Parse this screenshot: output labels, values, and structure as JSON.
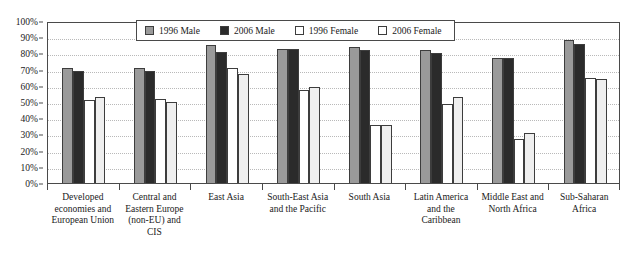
{
  "chart_data": {
    "type": "bar",
    "title": "",
    "subtitle": "",
    "xlabel": "",
    "ylabel": "",
    "ylim": [
      0,
      100
    ],
    "ytick_labels": [
      "0%",
      "10%",
      "20%",
      "30%",
      "40%",
      "50%",
      "60%",
      "70%",
      "80%",
      "90%",
      "100%"
    ],
    "ytick_values": [
      0,
      10,
      20,
      30,
      40,
      50,
      60,
      70,
      80,
      90,
      100
    ],
    "grid": true,
    "grid_axis": "y",
    "legend_position": "top-center",
    "categories": [
      "Developed economies and European Union",
      "Central and Eastern Europe (non-EU) and CIS",
      "East Asia",
      "South-East Asia and the Pacific",
      "South Asia",
      "Latin America and the Caribbean",
      "Middle East and North Africa",
      "Sub-Saharan Africa"
    ],
    "series": [
      {
        "name": "1996 Male",
        "color": "#9a9a9a",
        "values": [
          71,
          71,
          85,
          83,
          84,
          82,
          77,
          88
        ]
      },
      {
        "name": "2006 Male",
        "color": "#2b2b2b",
        "values": [
          69,
          69,
          81,
          83,
          82,
          80,
          77,
          86
        ]
      },
      {
        "name": "1996 Female",
        "color": "#ffffff",
        "values": [
          51.5,
          52,
          71,
          57.5,
          36,
          49,
          27,
          65
        ]
      },
      {
        "name": "2006 Female",
        "color": "#efefef",
        "values": [
          53,
          50,
          67,
          59,
          36,
          53,
          31,
          64
        ]
      }
    ]
  },
  "legend": {
    "items": [
      {
        "label": "1996 Male",
        "swatch": "s1996m"
      },
      {
        "label": "2006 Male",
        "swatch": "s2006m"
      },
      {
        "label": "1996 Female",
        "swatch": "s1996f"
      },
      {
        "label": "2006 Female",
        "swatch": "s2006f"
      }
    ]
  }
}
